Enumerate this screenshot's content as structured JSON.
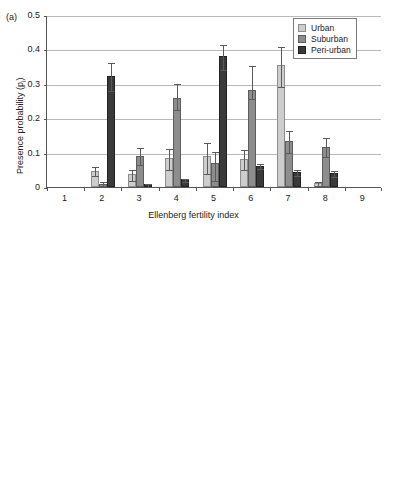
{
  "figure": {
    "panels": [
      {
        "label": "(a)",
        "xlabel": "Ellenberg fertility index",
        "ylabel_main": "Presence probability (p",
        "ylabel_sub": "i",
        "ylabel_close": ")"
      },
      {
        "label": "(b)",
        "xlabel": "Ellenberg fertility index",
        "ylabel_main": "Presence probability (p",
        "ylabel_sub": "i",
        "ylabel_close": ")"
      }
    ]
  },
  "legend": {
    "position": "top-right",
    "entries": [
      {
        "label": "Urban",
        "color": "#cdcdcd",
        "key": "urban"
      },
      {
        "label": "Suburban",
        "color": "#8d8d8d",
        "key": "suburban"
      },
      {
        "label": "Peri-urban",
        "color": "#3a3a3a",
        "key": "periurban"
      }
    ]
  },
  "yticks": [
    "0.5",
    "0.4",
    "0.3",
    "0.2",
    "0.1",
    "0"
  ],
  "ytick_values": [
    0.5,
    0.4,
    0.3,
    0.2,
    0.1,
    0
  ],
  "xticks": [
    "1",
    "2",
    "3",
    "4",
    "5",
    "6",
    "7",
    "8",
    "9"
  ],
  "chart_data": [
    {
      "type": "bar",
      "panel": "(a)",
      "title": "",
      "xlabel": "Ellenberg fertility index",
      "ylabel": "Presence probability (p_i)",
      "ylim": [
        0,
        0.5
      ],
      "grid": true,
      "legend_position": "top-right",
      "categories": [
        "1",
        "2",
        "3",
        "4",
        "5",
        "6",
        "7",
        "8",
        "9"
      ],
      "series": [
        {
          "name": "Urban",
          "color": "#cdcdcd",
          "values": [
            0,
            0.047,
            0.037,
            0.084,
            0.09,
            0.082,
            0.354,
            0.011,
            0
          ],
          "err_low": [
            0,
            0.012,
            0.016,
            0.031,
            0.048,
            0.03,
            0.06,
            0.005,
            0
          ],
          "err_high": [
            0,
            0.013,
            0.016,
            0.03,
            0.04,
            0.028,
            0.056,
            0.005,
            0
          ]
        },
        {
          "name": "Suburban",
          "color": "#8d8d8d",
          "values": [
            0,
            0.009,
            0.09,
            0.259,
            0.071,
            0.283,
            0.134,
            0.116,
            0
          ],
          "err_low": [
            0,
            0.006,
            0.023,
            0.032,
            0.05,
            0.025,
            0.031,
            0.026,
            0
          ],
          "err_high": [
            0,
            0.007,
            0.026,
            0.043,
            0.034,
            0.071,
            0.032,
            0.03,
            0
          ]
        },
        {
          "name": "Peri-urban",
          "color": "#3a3a3a",
          "values": [
            0,
            0.322,
            0.008,
            0.022,
            0.38,
            0.062,
            0.043,
            0.04,
            0
          ],
          "err_low": [
            0,
            0.04,
            0.004,
            0.005,
            0.036,
            0.007,
            0.009,
            0.009,
            0
          ],
          "err_high": [
            0,
            0.041,
            0.004,
            0.005,
            0.035,
            0.007,
            0.009,
            0.01,
            0
          ]
        }
      ]
    },
    {
      "type": "bar",
      "panel": "(b)",
      "title": "",
      "xlabel": "Ellenberg fertility index",
      "ylabel": "Presence probability (p_i)",
      "ylim": [
        0,
        0.5
      ],
      "grid": true,
      "legend_position": "top-right",
      "categories": [
        "1",
        "2",
        "3",
        "4",
        "5",
        "6",
        "7",
        "8",
        "9"
      ],
      "series": [
        {
          "name": "Urban",
          "color": "#cdcdcd",
          "values": [
            0,
            0.003,
            0.012,
            0.09,
            0.04,
            0.348,
            0.324,
            0.079,
            0.032
          ],
          "err_low": [
            0,
            0.002,
            0.005,
            0.032,
            0.01,
            0.048,
            0.037,
            0.03,
            0.009
          ],
          "err_high": [
            0,
            0.002,
            0.005,
            0.027,
            0.01,
            0.028,
            0.031,
            0.027,
            0.009
          ]
        },
        {
          "name": "Suburban",
          "color": "#8d8d8d",
          "values": [
            0,
            0.003,
            0.005,
            0.006,
            0.058,
            0.423,
            0.239,
            0.126,
            0.058
          ],
          "err_low": [
            0,
            0.002,
            0.003,
            0.003,
            0.022,
            0.045,
            0.037,
            0.038,
            0.017
          ],
          "err_high": [
            0,
            0.002,
            0.003,
            0.003,
            0.021,
            0.045,
            0.031,
            0.04,
            0.017
          ]
        },
        {
          "name": "Peri-urban",
          "color": "#3a3a3a",
          "values": [
            0,
            0.002,
            0.253,
            0.089,
            0.145,
            0.418,
            0.027,
            0.044,
            0
          ],
          "err_low": [
            0,
            0.001,
            0.043,
            0.011,
            0.018,
            0.044,
            0.007,
            0.012,
            0
          ],
          "err_high": [
            0,
            0.001,
            0.043,
            0.011,
            0.018,
            0.044,
            0.007,
            0.012,
            0
          ]
        }
      ]
    }
  ]
}
